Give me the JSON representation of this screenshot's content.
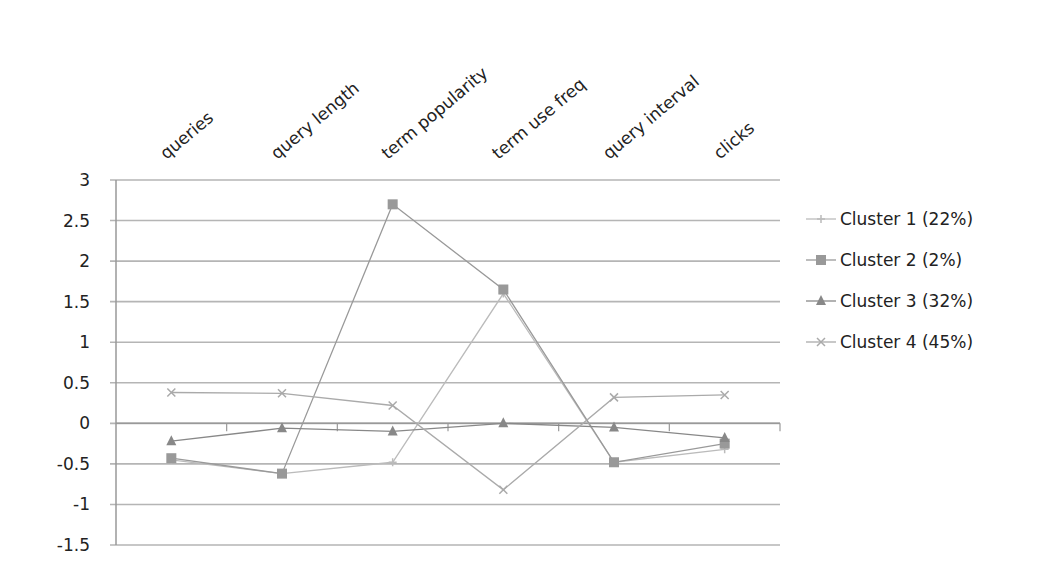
{
  "chart_data": {
    "type": "line",
    "title": "",
    "xlabel": "",
    "ylabel": "",
    "categories": [
      "queries",
      "query length",
      "term popularity",
      "term use freq",
      "query interval",
      "clicks"
    ],
    "ylim": [
      -1.5,
      3
    ],
    "yticks": [
      3,
      2.5,
      2,
      1.5,
      1,
      0.5,
      0,
      -0.5,
      -1,
      -1.5
    ],
    "ytick_labels": [
      "3",
      "2.5",
      "2",
      "1.5",
      "1",
      "0.5",
      "0",
      "-0.5",
      "-1",
      "-1.5"
    ],
    "grid": true,
    "legend_position": "right",
    "series": [
      {
        "name": "Cluster 1 (22%)",
        "marker": "plus",
        "color": "#bbbbbb",
        "values": [
          -0.45,
          -0.62,
          -0.48,
          1.6,
          -0.48,
          -0.32
        ]
      },
      {
        "name": "Cluster 2 (2%)",
        "marker": "square",
        "color": "#999999",
        "values": [
          -0.43,
          -0.62,
          2.7,
          1.65,
          -0.48,
          -0.25
        ]
      },
      {
        "name": "Cluster 3 (32%)",
        "marker": "triangle",
        "color": "#888888",
        "values": [
          -0.22,
          -0.06,
          -0.1,
          0.0,
          -0.05,
          -0.18
        ]
      },
      {
        "name": "Cluster 4 (45%)",
        "marker": "x",
        "color": "#aaaaaa",
        "values": [
          0.38,
          0.37,
          0.22,
          -0.82,
          0.32,
          0.35
        ]
      }
    ]
  }
}
